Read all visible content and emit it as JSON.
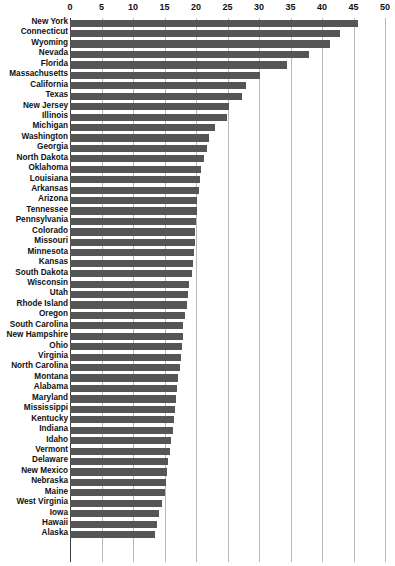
{
  "chart_data": {
    "type": "bar",
    "orientation": "horizontal",
    "title": "",
    "xlabel": "",
    "ylabel": "",
    "xlim": [
      0,
      50
    ],
    "xticks": [
      0,
      5,
      10,
      15,
      20,
      25,
      30,
      35,
      40,
      45,
      50
    ],
    "grid": true,
    "legend": false,
    "bar_color": "#555555",
    "categories": [
      "New York",
      "Connecticut",
      "Wyoming",
      "Nevada",
      "Florida",
      "Massachusetts",
      "California",
      "Texas",
      "New Jersey",
      "Illinois",
      "Michigan",
      "Washington",
      "Georgia",
      "North Dakota",
      "Oklahoma",
      "Louisiana",
      "Arkansas",
      "Arizona",
      "Tennessee",
      "Pennsylvania",
      "Colorado",
      "Missouri",
      "Minnesota",
      "Kansas",
      "South Dakota",
      "Wisconsin",
      "Utah",
      "Rhode Island",
      "Oregon",
      "South Carolina",
      "New Hampshire",
      "Ohio",
      "Virginia",
      "North Carolina",
      "Montana",
      "Alabama",
      "Maryland",
      "Mississippi",
      "Kentucky",
      "Indiana",
      "Idaho",
      "Vermont",
      "Delaware",
      "New Mexico",
      "Nebraska",
      "Maine",
      "West Virginia",
      "Iowa",
      "Hawaii",
      "Alaska"
    ],
    "values": [
      45.7,
      42.8,
      41.3,
      38.0,
      34.5,
      30.2,
      28.0,
      27.3,
      25.2,
      24.9,
      23.0,
      22.0,
      21.7,
      21.3,
      20.8,
      20.6,
      20.4,
      20.2,
      20.1,
      20.0,
      19.9,
      19.8,
      19.7,
      19.5,
      19.3,
      18.9,
      18.7,
      18.5,
      18.3,
      18.0,
      17.9,
      17.8,
      17.6,
      17.4,
      17.2,
      17.0,
      16.9,
      16.7,
      16.5,
      16.3,
      16.1,
      15.8,
      15.6,
      15.4,
      15.2,
      15.0,
      14.6,
      14.2,
      13.8,
      13.5
    ]
  },
  "axis": {
    "tick_labels": [
      "0",
      "5",
      "10",
      "15",
      "20",
      "25",
      "30",
      "35",
      "40",
      "45",
      "50"
    ]
  }
}
